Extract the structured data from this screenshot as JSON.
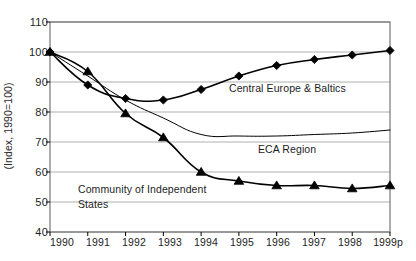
{
  "chart_data": {
    "type": "line",
    "title": "",
    "subtitle": "",
    "xlabel": "",
    "ylabel": "(Index, 1990=100)",
    "categories": [
      "1990",
      "1991",
      "1992",
      "1993",
      "1994",
      "1995",
      "1996",
      "1997",
      "1998",
      "1999p"
    ],
    "x": [
      1990,
      1991,
      1992,
      1993,
      1994,
      1995,
      1996,
      1997,
      1998,
      1999
    ],
    "ylim": [
      40,
      110
    ],
    "yticks": [
      40,
      50,
      60,
      70,
      80,
      90,
      100,
      110
    ],
    "ytick_labels": [
      "40",
      "50",
      "60",
      "70",
      "80",
      "90",
      "100",
      "110"
    ],
    "grid": true,
    "grid_axis": "y",
    "legend": "inline-annotations",
    "series": [
      {
        "name": "Central Europe & Baltics",
        "marker": "diamond",
        "color": "#000000",
        "values": [
          100,
          89,
          84.5,
          84,
          87.5,
          92,
          95.5,
          97.5,
          99,
          100.5
        ]
      },
      {
        "name": "Community of Independent States",
        "marker": "triangle",
        "color": "#000000",
        "values": [
          100,
          93.5,
          79.5,
          71.5,
          60,
          57,
          55.5,
          55.5,
          54.5,
          55.5
        ]
      },
      {
        "name": "ECA Region",
        "marker": "none",
        "color": "#000000",
        "values": [
          100,
          92,
          84,
          78,
          72.5,
          72,
          72,
          72.5,
          73,
          74
        ]
      }
    ],
    "annotations": [
      {
        "name": "central-europe-baltics",
        "text": "Central Europe & Baltics",
        "x_px": 229,
        "y_px": 89
      },
      {
        "name": "eca-region",
        "text": "ECA  Region",
        "x_px": 258,
        "y_px": 150
      },
      {
        "name": "community-independent-states-line1",
        "text": "Community of Independent",
        "x_px": 78,
        "y_px": 190
      },
      {
        "name": "community-independent-states-line2",
        "text": "States",
        "x_px": 78,
        "y_px": 205
      }
    ],
    "colors": {
      "axis": "#000000",
      "grid": "#b0b0b0",
      "frame": "#5a5a5a",
      "series": "#000000",
      "text": "#1d1d1d",
      "background": "#ffffff"
    }
  }
}
